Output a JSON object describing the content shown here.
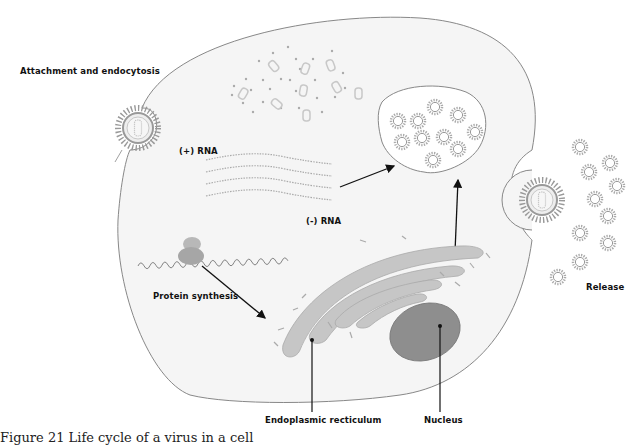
{
  "labels": {
    "attachment": "Attachment and endocytosis",
    "plus_rna": "(+) RNA",
    "minus_rna": "(-) RNA",
    "protein_synthesis": "Protein synthesis",
    "release": "Release",
    "er": "Endoplasmic recticulum",
    "nucleus": "Nucleus"
  },
  "caption": "Figure 21 Life cycle of a virus in a cell",
  "colors": {
    "cell_fill": "#f4f4f4",
    "cell_outline": "#777777",
    "virus_gray": "#a8a8a8",
    "er_fill": "#c4c4c4",
    "nucleus_fill": "#8a8a8a",
    "arrow": "#111111"
  },
  "icons": {
    "virus": "virus-icon",
    "ribosome": "ribosome-icon",
    "vesicle": "vesicle-icon",
    "nucleus": "nucleus-icon"
  }
}
